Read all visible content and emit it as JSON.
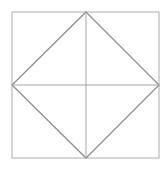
{
  "figure": {
    "name": "square-with-inscribed-diamond",
    "background_color": "#ffffff",
    "canvas": {
      "width": 168,
      "height": 172
    },
    "colors": {
      "square_stroke": "#b3b3b3",
      "diamond_stroke": "#8f8f8f",
      "median_stroke": "#a6a6a6"
    },
    "stroke_widths": {
      "square": 1.1,
      "diamond": 1.3,
      "median": 1.0
    },
    "square": {
      "name": "outer-square",
      "left": 12,
      "top": 12,
      "right": 159,
      "bottom": 158,
      "corners": [
        {
          "label": "top-left",
          "x": 12,
          "y": 12
        },
        {
          "label": "top-right",
          "x": 159,
          "y": 12
        },
        {
          "label": "bottom-right",
          "x": 159,
          "y": 158
        },
        {
          "label": "bottom-left",
          "x": 12,
          "y": 158
        }
      ]
    },
    "diamond": {
      "name": "inscribed-diamond",
      "vertices": [
        {
          "label": "top-midpoint",
          "x": 86,
          "y": 12
        },
        {
          "label": "right-midpoint",
          "x": 159,
          "y": 85
        },
        {
          "label": "bottom-midpoint",
          "x": 86,
          "y": 158
        },
        {
          "label": "left-midpoint",
          "x": 12,
          "y": 85
        }
      ]
    },
    "medians": [
      {
        "label": "vertical-median",
        "x1": 86,
        "y1": 12,
        "x2": 86,
        "y2": 158
      },
      {
        "label": "horizontal-median",
        "x1": 12,
        "y1": 85,
        "x2": 159,
        "y2": 85
      }
    ],
    "center": {
      "x": 86,
      "y": 85
    }
  }
}
